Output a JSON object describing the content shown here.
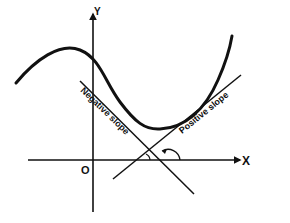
{
  "diagram": {
    "title": "",
    "colors": {
      "ink": "#111111",
      "background": "#ffffff"
    },
    "axes": {
      "x_label": "X",
      "y_label": "Y",
      "origin_label": "O"
    },
    "tangents": [
      {
        "label": "Negative slope",
        "slope_sign": "negative"
      },
      {
        "label": "Positive slope",
        "slope_sign": "positive"
      }
    ],
    "angles": [
      {
        "name": "acute-angle",
        "at_tangent": "Positive slope"
      },
      {
        "name": "obtuse-angle",
        "at_tangent": "Negative slope"
      }
    ],
    "curve": {
      "description": "smooth curve with local maximum at left, local minimum in the middle, rising steeply to the right"
    }
  }
}
